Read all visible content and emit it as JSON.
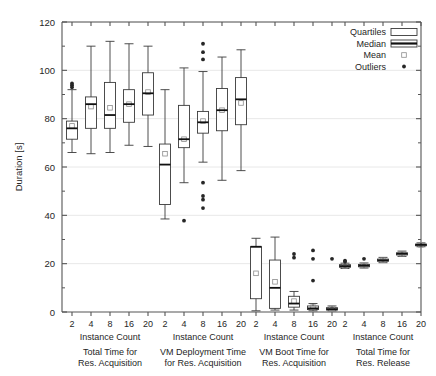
{
  "chart_data": {
    "type": "box",
    "title": "",
    "xlabel": "Instance Count",
    "ylabel": "Duration [s]",
    "ylim": [
      0,
      120
    ],
    "ytick_labels": [
      "0",
      "20",
      "40",
      "60",
      "80",
      "100",
      "120"
    ],
    "ytick_values": [
      0,
      20,
      40,
      60,
      80,
      100,
      120
    ],
    "minor_ticks_per_major": 2,
    "grid": true,
    "grid_axis": "y",
    "legend": {
      "position": "top-right",
      "entries": [
        {
          "label": "Quartiles",
          "symbol": "open-box"
        },
        {
          "label": "Median",
          "symbol": "box-with-thick-line"
        },
        {
          "label": "Mean",
          "symbol": "small-open-square"
        },
        {
          "label": "Outliers",
          "symbol": "filled-dot"
        }
      ]
    },
    "categories": [
      "2",
      "4",
      "8",
      "16",
      "20"
    ],
    "groups": [
      {
        "name": "Total Time for Res. Acquisition",
        "caption_line1": "Total Time for",
        "caption_line2": "Res. Acquisition",
        "axis_label": "Instance Count",
        "boxes": [
          {
            "category": "2",
            "whisker_low": 66.0,
            "q1": 71.5,
            "median": 76.0,
            "q3": 79.0,
            "whisker_high": 92.0,
            "mean": 77.0,
            "outliers": [
              93.0,
              93.8,
              94.6
            ]
          },
          {
            "category": "4",
            "whisker_low": 65.5,
            "q1": 76.0,
            "median": 86.0,
            "q3": 89.0,
            "whisker_high": 110.0,
            "mean": 85.0,
            "outliers": []
          },
          {
            "category": "8",
            "whisker_low": 66.0,
            "q1": 76.0,
            "median": 81.5,
            "q3": 95.0,
            "whisker_high": 112.0,
            "mean": 84.5,
            "outliers": []
          },
          {
            "category": "16",
            "whisker_low": 69.0,
            "q1": 78.5,
            "median": 86.0,
            "q3": 92.0,
            "whisker_high": 111.0,
            "mean": 86.0,
            "outliers": []
          },
          {
            "category": "20",
            "whisker_low": 68.5,
            "q1": 81.5,
            "median": 90.5,
            "q3": 99.0,
            "whisker_high": 110.0,
            "mean": 91.0,
            "outliers": []
          }
        ]
      },
      {
        "name": "VM Deployment Time for Res. Acquisition",
        "caption_line1": "VM Deployment Time",
        "caption_line2": "for Res. Acquisition",
        "axis_label": "Instance Count",
        "boxes": [
          {
            "category": "2",
            "whisker_low": 38.5,
            "q1": 44.5,
            "median": 61.0,
            "q3": 69.5,
            "whisker_high": 92.0,
            "mean": 65.5,
            "outliers": []
          },
          {
            "category": "4",
            "whisker_low": 53.5,
            "q1": 68.0,
            "median": 71.5,
            "q3": 85.5,
            "whisker_high": 101.0,
            "mean": 71.5,
            "outliers": [
              37.8
            ]
          },
          {
            "category": "8",
            "whisker_low": 62.0,
            "q1": 74.0,
            "median": 78.5,
            "q3": 83.0,
            "whisker_high": 99.5,
            "mean": 79.0,
            "outliers": [
              43.0,
              46.5,
              48.0,
              53.5,
              104.5,
              107.5,
              111.0
            ]
          },
          {
            "category": "16",
            "whisker_low": 54.5,
            "q1": 75.0,
            "median": 83.5,
            "q3": 92.5,
            "whisker_high": 105.5,
            "mean": 83.5,
            "outliers": []
          },
          {
            "category": "20",
            "whisker_low": 58.5,
            "q1": 77.5,
            "median": 88.0,
            "q3": 97.0,
            "whisker_high": 108.5,
            "mean": 86.5,
            "outliers": []
          }
        ]
      },
      {
        "name": "VM Boot Time for Res. Acquisition",
        "caption_line1": "VM Boot Time for",
        "caption_line2": "Res. Acquisition",
        "axis_label": "Instance Count",
        "boxes": [
          {
            "category": "2",
            "whisker_low": 0.5,
            "q1": 5.5,
            "median": 27.0,
            "q3": 27.0,
            "whisker_high": 30.5,
            "mean": 16.0,
            "outliers": []
          },
          {
            "category": "4",
            "whisker_low": 0.8,
            "q1": 1.5,
            "median": 10.0,
            "q3": 21.5,
            "whisker_high": 31.0,
            "mean": 12.5,
            "outliers": []
          },
          {
            "category": "8",
            "whisker_low": 0.8,
            "q1": 2.0,
            "median": 3.5,
            "q3": 6.5,
            "whisker_high": 8.5,
            "mean": 4.5,
            "outliers": [
              22.5,
              24.0
            ]
          },
          {
            "category": "16",
            "whisker_low": 0.5,
            "q1": 1.0,
            "median": 1.5,
            "q3": 2.5,
            "whisker_high": 3.5,
            "mean": 2.0,
            "outliers": [
              13.0,
              22.0,
              25.5
            ]
          },
          {
            "category": "20",
            "whisker_low": 0.5,
            "q1": 0.8,
            "median": 1.2,
            "q3": 1.8,
            "whisker_high": 2.5,
            "mean": 1.5,
            "outliers": [
              22.0
            ]
          }
        ]
      },
      {
        "name": "Total Time for Res. Release",
        "caption_line1": "Total Time for",
        "caption_line2": "Res. Release",
        "axis_label": "Instance Count",
        "boxes": [
          {
            "category": "2",
            "whisker_low": 18.0,
            "q1": 18.5,
            "median": 19.0,
            "q3": 19.6,
            "whisker_high": 20.2,
            "mean": 19.0,
            "outliers": [
              20.8,
              21.2
            ]
          },
          {
            "category": "4",
            "whisker_low": 18.2,
            "q1": 18.7,
            "median": 19.2,
            "q3": 19.7,
            "whisker_high": 20.3,
            "mean": 19.2,
            "outliers": [
              22.0
            ]
          },
          {
            "category": "8",
            "whisker_low": 20.4,
            "q1": 21.0,
            "median": 21.4,
            "q3": 21.9,
            "whisker_high": 22.6,
            "mean": 21.4,
            "outliers": []
          },
          {
            "category": "16",
            "whisker_low": 23.0,
            "q1": 23.6,
            "median": 24.1,
            "q3": 24.5,
            "whisker_high": 25.2,
            "mean": 24.1,
            "outliers": []
          },
          {
            "category": "20",
            "whisker_low": 27.0,
            "q1": 27.4,
            "median": 27.8,
            "q3": 28.1,
            "whisker_high": 28.6,
            "mean": 27.8,
            "outliers": []
          }
        ]
      }
    ]
  },
  "style": {
    "line_color": "#3a3a3a",
    "box_fill": "#ffffff",
    "grid_color": "#e8e8e8",
    "axis_color": "#555555",
    "outlier_color": "#262626"
  }
}
